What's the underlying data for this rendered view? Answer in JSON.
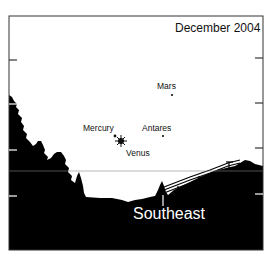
{
  "title": "December 2004",
  "direction": {
    "label": "Southeast"
  },
  "objects": [
    {
      "name": "Mars",
      "type": "planet"
    },
    {
      "name": "Mercury",
      "type": "planet"
    },
    {
      "name": "Venus",
      "type": "planet"
    },
    {
      "name": "Antares",
      "type": "star"
    }
  ],
  "colors": {
    "sky": "#ffffff",
    "ground": "#000000",
    "frame": "#333333"
  }
}
